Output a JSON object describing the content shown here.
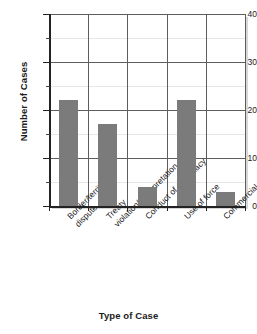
{
  "chart_data": {
    "type": "bar",
    "title": "",
    "xlabel": "Type of Case",
    "ylabel": "Number of Cases",
    "categories": [
      "Border/territorial dispute",
      "Treaty violation/ Interpretation",
      "Conduct of diplomacy",
      "Use of force",
      "Commercial dispute"
    ],
    "category_lines": [
      [
        "Border/territorial",
        "dispute"
      ],
      [
        "Treaty",
        "violation/ Interpretation"
      ],
      [
        "Conduct of diplomacy"
      ],
      [
        "Use of force"
      ],
      [
        "Commercial dispute"
      ]
    ],
    "values": [
      22,
      17,
      4,
      22,
      3
    ],
    "ylim": [
      0,
      40
    ],
    "ytick_labels": [
      "0",
      "10",
      "20",
      "30",
      "40"
    ],
    "ytick_values": [
      0,
      10,
      20,
      30,
      40
    ],
    "yminor_values": [
      5,
      15,
      25,
      35
    ],
    "grid": true,
    "legend": "none",
    "bar_color": "#7b7b7b",
    "axis_color": "#222222",
    "grid_major_color": "#5d5d5d",
    "grid_minor_color": "#e6e6e6"
  }
}
